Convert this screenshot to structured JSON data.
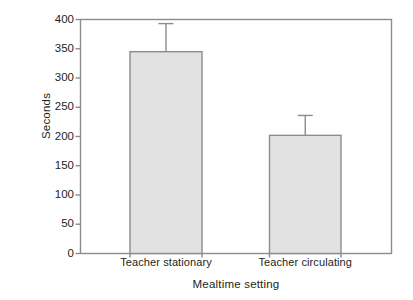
{
  "chart_data": {
    "type": "bar",
    "title": "",
    "subtitle": "",
    "xlabel": "Mealtime setting",
    "ylabel": "Seconds",
    "categories": [
      "Teacher stationary",
      "Teacher circulating"
    ],
    "values": [
      345,
      202
    ],
    "errors_upper": [
      48,
      34
    ],
    "error_tops": [
      393,
      236
    ],
    "ylim": [
      0,
      400
    ],
    "yticks": [
      0,
      50,
      100,
      150,
      200,
      250,
      300,
      350,
      400
    ],
    "ytick_labels": [
      "0",
      "50",
      "100",
      "150",
      "200",
      "250",
      "300",
      "350",
      "400"
    ],
    "grid": false,
    "legend": "none",
    "bar_fill_color": "#e2e2e2",
    "bar_edge_color": "#8c8c8c",
    "axis_color": "#8c8c8c",
    "error_bar_color": "#8c8c8c",
    "background_color": "#ffffff",
    "text_color": "#231f20"
  },
  "axes": {
    "y_axis_title": "Seconds",
    "x_axis_title": "Mealtime setting"
  }
}
